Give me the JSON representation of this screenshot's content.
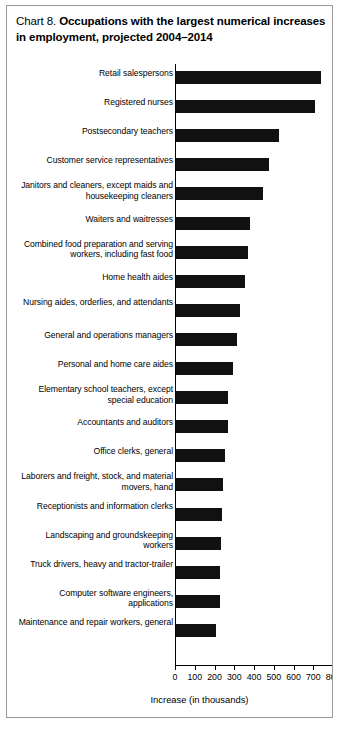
{
  "figure": {
    "title_prefix": "Chart 8.",
    "title_main": "Occupations with the largest numerical increases in employment, projected 2004–2014"
  },
  "chart_data": {
    "type": "bar",
    "orientation": "horizontal",
    "title": "Chart 8. Occupations with the largest numerical increases in employment, projected 2004–2014",
    "xlabel": "Increase (in thousands)",
    "ylabel": "",
    "xlim": [
      0,
      800
    ],
    "xticks": [
      0,
      100,
      200,
      300,
      400,
      500,
      600,
      700,
      800
    ],
    "xticklabels": [
      "0",
      "100",
      "200",
      "300",
      "400",
      "500",
      "600",
      "700",
      "800"
    ],
    "grid": false,
    "legend": null,
    "bar_color": "#111111",
    "categories": [
      "Retail salespersons",
      "Registered nurses",
      "Postsecondary teachers",
      "Customer service representatives",
      "Janitors and cleaners, except maids and housekeeping cleaners",
      "Waiters and waitresses",
      "Combined food preparation and serving workers, including fast food",
      "Home health aides",
      "Nursing aides, orderlies, and attendants",
      "General and operations managers",
      "Personal and home care aides",
      "Elementary school teachers, except special education",
      "Accountants and auditors",
      "Office clerks, general",
      "Laborers and freight, stock, and material movers, hand",
      "Receptionists and information clerks",
      "Landscaping and groundskeeping workers",
      "Truck drivers, heavy and tractor-trailer",
      "Computer software engineers, applications",
      "Maintenance and repair workers, general"
    ],
    "values": [
      736,
      703,
      524,
      471,
      440,
      376,
      367,
      350,
      325,
      308,
      287,
      265,
      264,
      246,
      239,
      235,
      230,
      223,
      222,
      202
    ]
  }
}
